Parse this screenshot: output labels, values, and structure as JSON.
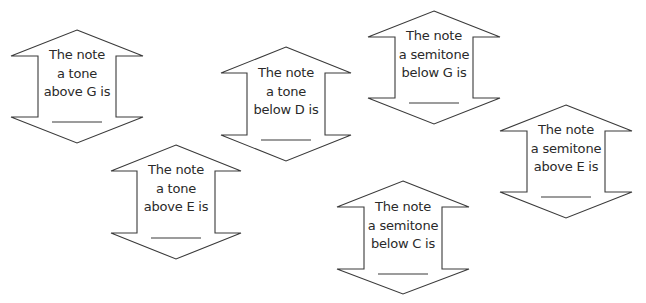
{
  "worksheet": {
    "cards": [
      {
        "id": "tone-above-g",
        "lines": [
          "The note",
          "a tone",
          "above G is"
        ],
        "answer": "",
        "geometry": {
          "cx": 77,
          "apex_y": 30,
          "wing_y": 56,
          "bottom_wing_y": 117,
          "tip_y": 143,
          "half_wing": 66,
          "half_shaft": 39
        }
      },
      {
        "id": "tone-below-d",
        "lines": [
          "The note",
          "a tone",
          "below D is"
        ],
        "answer": "",
        "geometry": {
          "cx": 286,
          "apex_y": 47,
          "wing_y": 73,
          "bottom_wing_y": 135,
          "tip_y": 161,
          "half_wing": 65,
          "half_shaft": 39
        }
      },
      {
        "id": "semitone-below-g",
        "lines": [
          "The note",
          "a semitone",
          "below G is"
        ],
        "answer": "",
        "geometry": {
          "cx": 434,
          "apex_y": 11,
          "wing_y": 37,
          "bottom_wing_y": 98,
          "tip_y": 124,
          "half_wing": 66,
          "half_shaft": 39
        }
      },
      {
        "id": "semitone-above-e",
        "lines": [
          "The note",
          "a semitone",
          "above E is"
        ],
        "answer": "",
        "geometry": {
          "cx": 566,
          "apex_y": 105,
          "wing_y": 131,
          "bottom_wing_y": 192,
          "tip_y": 218,
          "half_wing": 66,
          "half_shaft": 39
        }
      },
      {
        "id": "tone-above-e",
        "lines": [
          "The note",
          "a tone",
          "above E is"
        ],
        "answer": "",
        "geometry": {
          "cx": 176,
          "apex_y": 145,
          "wing_y": 171,
          "bottom_wing_y": 233,
          "tip_y": 259,
          "half_wing": 65,
          "half_shaft": 39
        }
      },
      {
        "id": "semitone-below-c",
        "lines": [
          "The note",
          "a semitone",
          "below C is"
        ],
        "answer": "",
        "geometry": {
          "cx": 403,
          "apex_y": 181,
          "wing_y": 207,
          "bottom_wing_y": 269,
          "tip_y": 294,
          "half_wing": 66,
          "half_shaft": 39
        }
      }
    ],
    "colors": {
      "stroke": "#3a3a3a",
      "text": "#2a2a2a",
      "background": "#ffffff"
    }
  }
}
